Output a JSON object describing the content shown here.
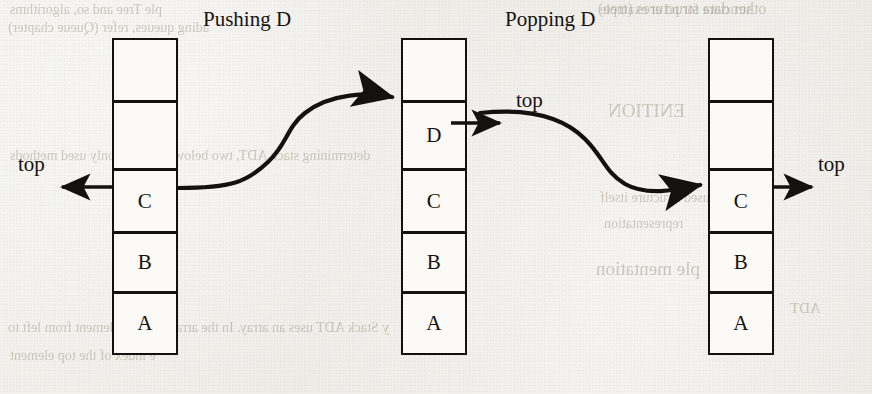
{
  "figure": {
    "title_left": "Pushing D",
    "title_right": "Popping D",
    "type": "stack-operations-diagram"
  },
  "captions": {
    "pushing": "Pushing D",
    "popping": "Popping D"
  },
  "pointer_labels": {
    "left": "top",
    "middle": "top",
    "right": "top"
  },
  "stacks": [
    {
      "id": "stack-before",
      "name": "initial-stack",
      "cells": [
        "",
        "",
        "C",
        "B",
        "A"
      ],
      "top_index": 2,
      "top_value": "C"
    },
    {
      "id": "stack-after-push",
      "name": "stack-after-push",
      "cells": [
        "",
        "D",
        "C",
        "B",
        "A"
      ],
      "top_index": 1,
      "top_value": "D"
    },
    {
      "id": "stack-after-pop",
      "name": "stack-after-pop",
      "cells": [
        "",
        "",
        "C",
        "B",
        "A"
      ],
      "top_index": 2,
      "top_value": "C"
    }
  ],
  "arrows": [
    {
      "name": "push-flow-arrow",
      "from": "stack-before.top",
      "to": "stack-after-push.D"
    },
    {
      "name": "pop-flow-arrow",
      "from": "stack-after-push.D",
      "to": "stack-after-pop.top"
    },
    {
      "name": "left-top-pointer",
      "direction": "left"
    },
    {
      "name": "middle-top-pointer",
      "direction": "right"
    },
    {
      "name": "right-top-pointer",
      "direction": "right"
    }
  ],
  "colors": {
    "ink": "#14120f",
    "paper": "#efeeea",
    "cell_fill": "#fbfaf7",
    "ghost_text": "#9d968a"
  },
  "bleed_through": {
    "line1": "structure for pd er example",
    "line2": "other data structures (tree)",
    "line3": "ple Tree and so, algorithms",
    "line4": "ading queues, refer (Queue chapter)",
    "line5": "determining stack ADT, two below are commonly used methods",
    "line6": "used structure itself",
    "line7": "representation",
    "line8": "ple mentation",
    "line9": "y Stack ADT uses an array. In the array, we add element from left to",
    "line10": "e index of the top element",
    "line11": "ENITION",
    "line12": "T",
    "line13": "ADT"
  }
}
